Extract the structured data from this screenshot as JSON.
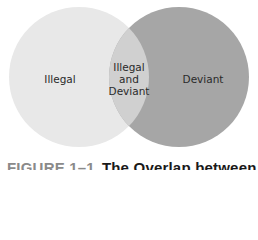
{
  "diagram": {
    "type": "venn",
    "sets": [
      {
        "name": "left-set",
        "label": "Illegal",
        "color": "#e8e8e8"
      },
      {
        "name": "right-set",
        "label": "Deviant",
        "color": "#a6a6a6"
      }
    ],
    "intersection": {
      "lines": [
        "Illegal",
        "and",
        "Deviant"
      ],
      "color": "#d0d0d0"
    }
  },
  "caption": {
    "figure_number": "FIGURE 1–1",
    "title": "The Overlap between"
  }
}
